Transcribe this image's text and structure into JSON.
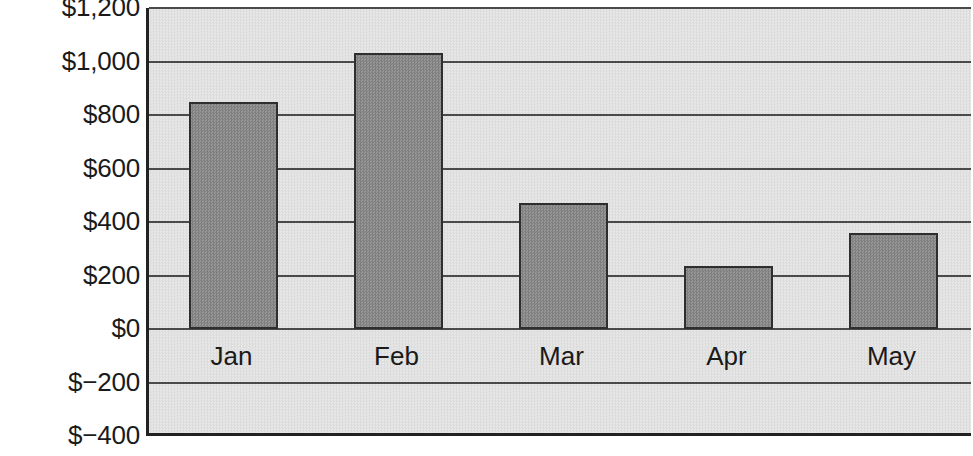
{
  "chart_data": {
    "type": "bar",
    "title": "",
    "subtitle": "",
    "xlabel": "",
    "ylabel": "",
    "categories": [
      "Jan",
      "Feb",
      "Mar",
      "Apr",
      "May"
    ],
    "values": [
      850,
      1030,
      470,
      235,
      360
    ],
    "series": [
      {
        "name": "",
        "values": [
          850,
          1030,
          470,
          235,
          360
        ]
      }
    ],
    "ylim": [
      -400,
      1200
    ],
    "ytick_values": [
      1200,
      1000,
      800,
      600,
      400,
      200,
      0,
      -200,
      -400
    ],
    "ytick_labels": [
      "$1,200",
      "$1,000",
      "$800",
      "$600",
      "$400",
      "$200",
      "$0",
      "$−200",
      "$−400"
    ],
    "grid": true,
    "grid_axis": "y",
    "legend": false,
    "legend_entries": [],
    "annotations": [],
    "bar_color": "#8a8a8a",
    "bar_border_color": "#2e2e2e",
    "plot_background_color": "#e3e3e3",
    "axis_color": "#222222",
    "gridline_color": "#4a4a4a",
    "text_color": "#1a1a1a",
    "baseline_value": 0
  }
}
